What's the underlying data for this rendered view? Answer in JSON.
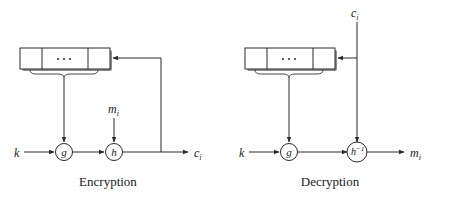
{
  "figure": {
    "type": "block-diagram",
    "panels": [
      {
        "id": "encryption",
        "caption": "Encryption",
        "register": {
          "name": "shift-register",
          "cells": 3,
          "middle_label": "..."
        },
        "nodes": [
          {
            "id": "g",
            "label": "g",
            "shape": "circle"
          },
          {
            "id": "h",
            "label": "h",
            "shape": "circle"
          }
        ],
        "inputs": [
          {
            "id": "key",
            "label": "k",
            "position": "left"
          },
          {
            "id": "message",
            "label": "m",
            "subscript": "i",
            "position": "top"
          }
        ],
        "outputs": [
          {
            "id": "cipher",
            "label": "c",
            "subscript": "i",
            "position": "right"
          }
        ],
        "feedback": "output c_i feeds back into shift register"
      },
      {
        "id": "decryption",
        "caption": "Decryption",
        "register": {
          "name": "shift-register",
          "cells": 3,
          "middle_label": "..."
        },
        "nodes": [
          {
            "id": "g",
            "label": "g",
            "shape": "circle"
          },
          {
            "id": "hinv",
            "label": "h",
            "superscript": "−1",
            "shape": "circle"
          }
        ],
        "inputs": [
          {
            "id": "key",
            "label": "k",
            "position": "left"
          },
          {
            "id": "cipher",
            "label": "c",
            "subscript": "i",
            "position": "top"
          }
        ],
        "outputs": [
          {
            "id": "message",
            "label": "m",
            "subscript": "i",
            "position": "right"
          }
        ],
        "feedback": "input c_i branches into shift register"
      }
    ]
  },
  "labels": {
    "enc_k": "k",
    "enc_m_base": "m",
    "enc_m_sub": "i",
    "enc_c_base": "c",
    "enc_c_sub": "i",
    "enc_g": "g",
    "enc_h": "h",
    "enc_dots": "· · ·",
    "enc_caption": "Encryption",
    "dec_k": "k",
    "dec_c_base": "c",
    "dec_c_sub": "i",
    "dec_m_base": "m",
    "dec_m_sub": "i",
    "dec_g": "g",
    "dec_h_base": "h",
    "dec_h_sup": "−1",
    "dec_dots": "· · ·",
    "dec_caption": "Decryption"
  },
  "colors": {
    "background": "#ffffff",
    "stroke": "#2a2a2a",
    "text": "#1a1a1a",
    "shadow": "#8d8d8d"
  }
}
